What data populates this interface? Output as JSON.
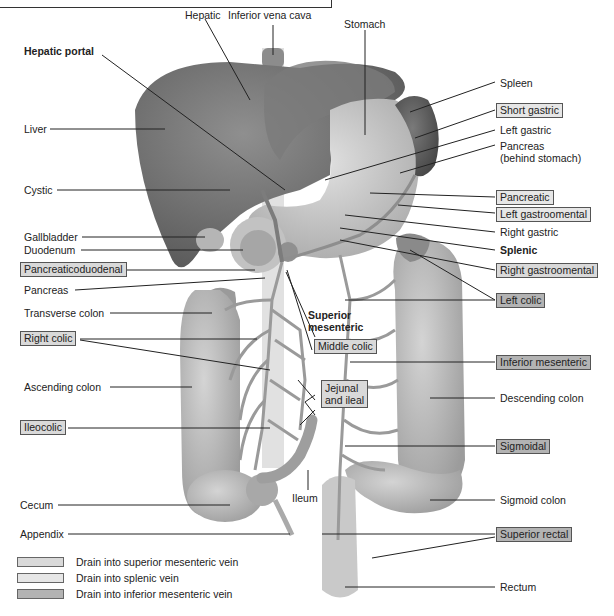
{
  "diagram": {
    "colors": {
      "superior_mesenteric": "#d9d9d9",
      "splenic": "#e6e6e6",
      "inferior_mesenteric": "#b3b3b3",
      "organ_dark": "#6e6e6e",
      "organ_light": "#b8b8b8",
      "vessel": "#9a9a9a"
    },
    "labels": {
      "hepatic": "Hepatic",
      "inferior_vena_cava": "Inferior vena cava",
      "stomach": "Stomach",
      "hepatic_portal": "Hepatic portal",
      "liver": "Liver",
      "cystic": "Cystic",
      "gallbladder": "Gallbladder",
      "duodenum": "Duodenum",
      "pancreaticoduodenal": "Pancreaticoduodenal",
      "pancreas": "Pancreas",
      "transverse_colon": "Transverse colon",
      "right_colic": "Right colic",
      "ascending_colon": "Ascending colon",
      "ileocolic": "Ileocolic",
      "cecum": "Cecum",
      "appendix": "Appendix",
      "ileum": "Ileum",
      "superior_mesenteric": "Superior",
      "superior_mesenteric_2": "mesenteric",
      "middle_colic": "Middle colic",
      "jejunal_ileal": "Jejunal",
      "jejunal_ileal_2": "and ileal",
      "spleen": "Spleen",
      "short_gastric": "Short gastric",
      "left_gastric": "Left gastric",
      "pancreas_behind": "Pancreas",
      "pancreas_behind_2": "(behind stomach)",
      "pancreatic": "Pancreatic",
      "left_gastroomental": "Left gastroomental",
      "right_gastric": "Right gastric",
      "splenic": "Splenic",
      "right_gastroomental": "Right gastroomental",
      "left_colic": "Left colic",
      "inferior_mesenteric": "Inferior mesenteric",
      "descending_colon": "Descending colon",
      "sigmoidal": "Sigmoidal",
      "sigmoid_colon": "Sigmoid colon",
      "superior_rectal": "Superior rectal",
      "rectum": "Rectum"
    },
    "legend": [
      {
        "label": "Drain into superior mesenteric vein",
        "color": "#d9d9d9"
      },
      {
        "label": "Drain into splenic vein",
        "color": "#e6e6e6"
      },
      {
        "label": "Drain into inferior mesenteric vein",
        "color": "#b3b3b3"
      }
    ]
  }
}
